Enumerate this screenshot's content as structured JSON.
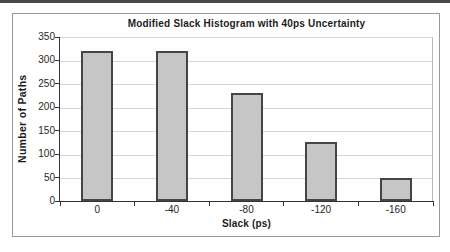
{
  "page": {
    "top_rule_color": "#474747"
  },
  "chart_data": {
    "type": "bar",
    "title": "Modified Slack Histogram with 40ps Uncertainty",
    "xlabel": "Slack (ps)",
    "ylabel": "Number of Paths",
    "categories": [
      "0",
      "-40",
      "-80",
      "-120",
      "-160"
    ],
    "values": [
      320,
      320,
      230,
      125,
      50
    ],
    "ylim": [
      0,
      350
    ],
    "yticks": [
      0,
      50,
      100,
      150,
      200,
      250,
      300,
      350
    ],
    "grid": "horizontal",
    "legend": "none",
    "colors": {
      "bar_fill": "#c6c6c6",
      "bar_border": "#454545",
      "gridline": "#d6d6d6",
      "axis": "#333333",
      "frame_border": "#9a9a9a",
      "plot_right_border": "#b8b8b8",
      "text": "#1c1c1c"
    }
  }
}
